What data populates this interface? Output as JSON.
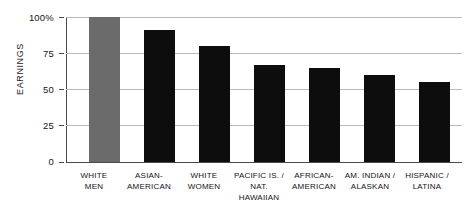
{
  "chart_data": {
    "type": "bar",
    "title": "",
    "subtitle": "",
    "xlabel": "",
    "ylabel": "EARNINGS",
    "ylim": [
      0,
      100
    ],
    "yticks": [
      0,
      25,
      50,
      75,
      100
    ],
    "ytick_labels": [
      "0",
      "25",
      "50",
      "75",
      "100%"
    ],
    "grid": true,
    "legend": "none",
    "unit": "percent",
    "categories": [
      "WHITE MEN",
      "ASIAN-AMERICAN",
      "WHITE WOMEN",
      "PACIFIC IS. / NAT. HAWAIIAN",
      "AFRICAN-AMERICAN",
      "AM. INDIAN / ALASKAN",
      "HISPANIC / LATINA"
    ],
    "category_lines": [
      [
        "WHITE",
        "MEN"
      ],
      [
        "ASIAN-",
        "AMERICAN"
      ],
      [
        "WHITE",
        "WOMEN"
      ],
      [
        "PACIFIC IS. /",
        "NAT. HAWAIIAN"
      ],
      [
        "AFRICAN-",
        "AMERICAN"
      ],
      [
        "AM. INDIAN /",
        "ALASKAN"
      ],
      [
        "HISPANIC /",
        "LATINA"
      ]
    ],
    "values": [
      100,
      91,
      80,
      67,
      65,
      60,
      55
    ],
    "bar_colors": [
      "#6b6b6b",
      "#0d0d0d",
      "#0d0d0d",
      "#0d0d0d",
      "#0d0d0d",
      "#0d0d0d",
      "#0d0d0d"
    ],
    "reference_category": "WHITE MEN",
    "axis_color": "#4a4a4a",
    "grid_color": "#b9b9b9"
  }
}
